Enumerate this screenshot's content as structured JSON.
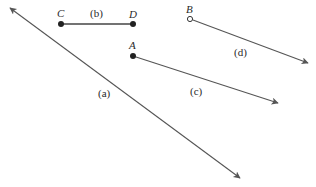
{
  "diagram": {
    "type": "geometry-figures",
    "colors": {
      "stroke": "#555555",
      "text": "#2a2a2a",
      "background": "#ffffff"
    },
    "figures": [
      {
        "id": "a",
        "label": "(a)",
        "kind": "line",
        "icon": "double-arrow-line"
      },
      {
        "id": "b",
        "label": "(b)",
        "kind": "segment",
        "endpoints": [
          "C",
          "D"
        ],
        "icon": "closed-endpoints"
      },
      {
        "id": "c",
        "label": "(c)",
        "kind": "ray",
        "endpoint": "A",
        "endpoint_style": "closed",
        "icon": "arrow-ray"
      },
      {
        "id": "d",
        "label": "(d)",
        "kind": "ray",
        "endpoint": "B",
        "endpoint_style": "open",
        "icon": "arrow-ray"
      }
    ],
    "points": {
      "A": "A",
      "B": "B",
      "C": "C",
      "D": "D"
    }
  }
}
